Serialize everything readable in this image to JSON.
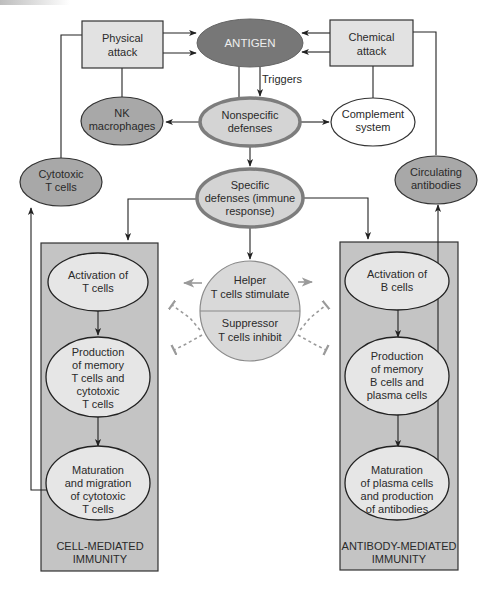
{
  "colors": {
    "antigen_fill": "#7a7a7a",
    "dark_node": "#a9a9a9",
    "light_node": "#d6d6d6",
    "box_fill": "#e2e2e2",
    "panel_fill": "#bdbdbd",
    "panel_inner": "#c9c9c9",
    "thick_border": "#7d7d7d",
    "line": "#222222"
  },
  "nodes": {
    "antigen": {
      "label": "ANTIGEN"
    },
    "physical_attack": {
      "lines": [
        "Physical",
        "attack"
      ]
    },
    "chemical_attack": {
      "lines": [
        "Chemical",
        "attack"
      ]
    },
    "nk_macrophages": {
      "lines": [
        "NK",
        "macrophages"
      ]
    },
    "nonspecific_defenses": {
      "lines": [
        "Nonspecific",
        "defenses"
      ]
    },
    "complement_system": {
      "lines": [
        "Complement",
        "system"
      ]
    },
    "cytotoxic_t_cells": {
      "lines": [
        "Cytotoxic",
        "T cells"
      ]
    },
    "circulating_antibodies": {
      "lines": [
        "Circulating",
        "antibodies"
      ]
    },
    "specific_defenses": {
      "lines": [
        "Specific",
        "defenses (immune",
        "response)"
      ]
    },
    "helper": {
      "lines": [
        "Helper",
        "T cells stimulate"
      ]
    },
    "suppressor": {
      "lines": [
        "Suppressor",
        "T cells inhibit"
      ]
    }
  },
  "edge_labels": {
    "triggers": "Triggers"
  },
  "cell_mediated": {
    "steps": [
      {
        "lines": [
          "Activation of",
          "T cells"
        ]
      },
      {
        "lines": [
          "Production",
          "of memory",
          "T cells and",
          "cytotoxic",
          "T cells"
        ]
      },
      {
        "lines": [
          "Maturation",
          "and migration",
          "of cytotoxic",
          "T cells"
        ]
      }
    ],
    "label": [
      "CELL-MEDIATED",
      "IMMUNITY"
    ]
  },
  "antibody_mediated": {
    "steps": [
      {
        "lines": [
          "Activation of",
          "B cells"
        ]
      },
      {
        "lines": [
          "Production",
          "of memory",
          "B cells and",
          "plasma cells"
        ]
      },
      {
        "lines": [
          "Maturation",
          "of plasma cells",
          "and production",
          "of antibodies"
        ]
      }
    ],
    "label": [
      "ANTIBODY-MEDIATED",
      "IMMUNITY"
    ]
  }
}
